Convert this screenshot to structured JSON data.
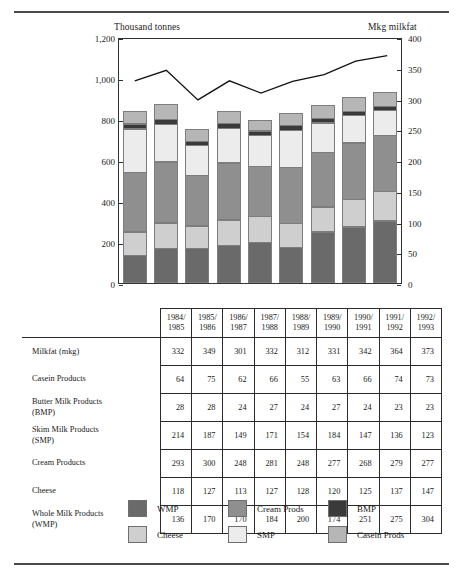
{
  "chart_data": {
    "type": "bar",
    "subtype": "stacked-bar-with-line-overlay",
    "title": "",
    "xlabel": "",
    "ylabel": "Thousand tonnes",
    "y2label": "Mkg milkfat",
    "ylim": [
      0,
      1200
    ],
    "y2lim": [
      0,
      400
    ],
    "yticks": [
      "0",
      "200",
      "400",
      "600",
      "800",
      "1,000",
      "1,200"
    ],
    "ytick_values": [
      0,
      200,
      400,
      600,
      800,
      1000,
      1200
    ],
    "y2ticks": [
      "0",
      "50",
      "100",
      "150",
      "200",
      "250",
      "300",
      "350",
      "400"
    ],
    "y2tick_values": [
      0,
      50,
      100,
      150,
      200,
      250,
      300,
      350,
      400
    ],
    "grid": false,
    "legend_position": "bottom",
    "categories": [
      "1984/1985",
      "1985/1986",
      "1986/1987",
      "1987/1988",
      "1988/1989",
      "1989/1990",
      "1990/1991",
      "1991/1992",
      "1992/1993"
    ],
    "category_lines": [
      [
        "1984/",
        "1985"
      ],
      [
        "1985/",
        "1986"
      ],
      [
        "1986/",
        "1987"
      ],
      [
        "1987/",
        "1988"
      ],
      [
        "1988/",
        "1989"
      ],
      [
        "1989/",
        "1990"
      ],
      [
        "1990/",
        "1991"
      ],
      [
        "1991/",
        "1992"
      ],
      [
        "1992/",
        "1993"
      ]
    ],
    "stack_order_bottom_to_top": [
      "WMP",
      "Cheese",
      "Cream Prods",
      "SMP",
      "BMP",
      "Casein Prods"
    ],
    "series": [
      {
        "name": "WMP",
        "axis": "left",
        "color": "#6a6a6a",
        "values": [
          136,
          170,
          170,
          184,
          200,
          174,
          251,
          275,
          304
        ]
      },
      {
        "name": "Cheese",
        "axis": "left",
        "color": "#cfcfcf",
        "values": [
          118,
          127,
          113,
          127,
          128,
          120,
          125,
          137,
          147
        ]
      },
      {
        "name": "Cream Prods",
        "axis": "left",
        "color": "#8f8f8f",
        "values": [
          293,
          300,
          248,
          281,
          248,
          277,
          268,
          279,
          277
        ]
      },
      {
        "name": "SMP",
        "axis": "left",
        "color": "#ececec",
        "values": [
          214,
          187,
          149,
          171,
          154,
          184,
          147,
          136,
          123
        ]
      },
      {
        "name": "BMP",
        "axis": "left",
        "color": "#3a3a3a",
        "values": [
          28,
          28,
          24,
          27,
          24,
          27,
          24,
          23,
          23
        ]
      },
      {
        "name": "Casein Prods",
        "axis": "left",
        "color": "#b6b6b6",
        "values": [
          64,
          75,
          62,
          66,
          55,
          63,
          66,
          74,
          73
        ]
      },
      {
        "name": "Milkfat (mkg)",
        "axis": "right",
        "color": "#111111",
        "type": "line",
        "values": [
          332,
          349,
          301,
          332,
          312,
          331,
          342,
          364,
          373
        ]
      }
    ],
    "table": {
      "columns": [
        "1984/1985",
        "1985/1986",
        "1986/1987",
        "1987/1988",
        "1988/1989",
        "1989/1990",
        "1990/1991",
        "1991/1992",
        "1992/1993"
      ],
      "rows": [
        {
          "label": "Milkfat (mkg)",
          "values": [
            332,
            349,
            301,
            332,
            312,
            331,
            342,
            364,
            373
          ]
        },
        {
          "label": "Casein Products",
          "values": [
            64,
            75,
            62,
            66,
            55,
            63,
            66,
            74,
            73
          ]
        },
        {
          "label": "Butter Milk Products (BMP)",
          "values": [
            28,
            28,
            24,
            27,
            24,
            27,
            24,
            23,
            23
          ]
        },
        {
          "label": "Skim Milk Products (SMP)",
          "values": [
            214,
            187,
            149,
            171,
            154,
            184,
            147,
            136,
            123
          ]
        },
        {
          "label": "Cream Products",
          "values": [
            293,
            300,
            248,
            281,
            248,
            277,
            268,
            279,
            277
          ]
        },
        {
          "label": "Cheese",
          "values": [
            118,
            127,
            113,
            127,
            128,
            120,
            125,
            137,
            147
          ]
        },
        {
          "label": "Whole Milk Products (WMP)",
          "values": [
            136,
            170,
            170,
            184,
            200,
            174,
            251,
            275,
            304
          ]
        }
      ],
      "row_label_lines": [
        [
          "Milkfat (mkg)"
        ],
        [
          "Casein Products"
        ],
        [
          "Butter Milk Products",
          "(BMP)"
        ],
        [
          "Skim Milk Products",
          "(SMP)"
        ],
        [
          "Cream Products"
        ],
        [
          "Cheese"
        ],
        [
          "Whole Milk Products",
          "(WMP)"
        ]
      ]
    },
    "legend": [
      {
        "label": "WMP",
        "color": "#6a6a6a"
      },
      {
        "label": "Cheese",
        "color": "#cfcfcf"
      },
      {
        "label": "Cream Prods",
        "color": "#8f8f8f"
      },
      {
        "label": "SMP",
        "color": "#ececec"
      },
      {
        "label": "BMP",
        "color": "#3a3a3a"
      },
      {
        "label": "Casein Prods",
        "color": "#b6b6b6"
      }
    ]
  }
}
